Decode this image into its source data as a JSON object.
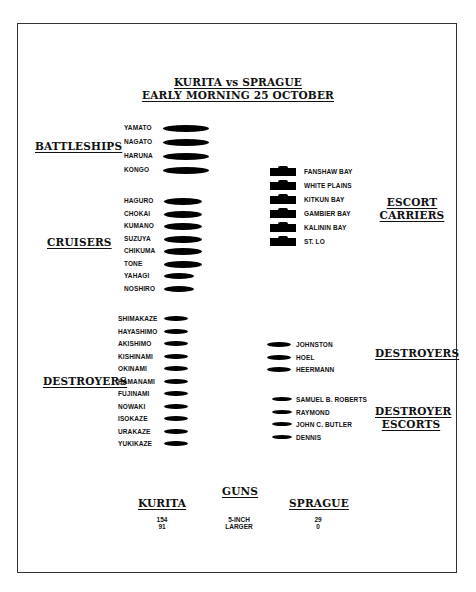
{
  "title": {
    "line1": "KURITA vs SPRAGUE",
    "line2": "EARLY MORNING 25 OCTOBER"
  },
  "japanese": {
    "battleships": {
      "label": "BATTLESHIPS",
      "ships": [
        "YAMATO",
        "NAGATO",
        "HARUNA",
        "KONGO"
      ]
    },
    "cruisers": {
      "label": "CRUISERS",
      "ships": [
        "HAGURO",
        "CHOKAI",
        "KUMANO",
        "SUZUYA",
        "CHIKUMA",
        "TONE",
        "YAHAGI",
        "NOSHIRO"
      ]
    },
    "destroyers": {
      "label": "DESTROYERS",
      "ships": [
        "SHIMAKAZE",
        "HAYASHIMO",
        "AKISHIMO",
        "KISHINAMI",
        "OKINAMI",
        "HAMANAMI",
        "FUJINAMI",
        "NOWAKI",
        "ISOKAZE",
        "URAKAZE",
        "YUKIKAZE"
      ]
    }
  },
  "american": {
    "escort_carriers": {
      "label_line1": "ESCORT",
      "label_line2": "CARRIERS",
      "ships": [
        "FANSHAW BAY",
        "WHITE PLAINS",
        "KITKUN BAY",
        "GAMBIER BAY",
        "KALININ BAY",
        "ST. LO"
      ]
    },
    "destroyers": {
      "label": "DESTROYERS",
      "ships": [
        "JOHNSTON",
        "HOEL",
        "HEERMANN"
      ]
    },
    "destroyer_escorts": {
      "label_line1": "DESTROYER",
      "label_line2": "ESCORTS",
      "ships": [
        "SAMUEL B. ROBERTS",
        "RAYMOND",
        "JOHN C. BUTLER",
        "DENNIS"
      ]
    }
  },
  "guns": {
    "heading": "GUNS",
    "left_header": "KURITA",
    "right_header": "SPRAGUE",
    "rows": [
      {
        "kurita": "154",
        "type": "5-INCH",
        "sprague": "29"
      },
      {
        "kurita": "91",
        "type": "LARGER",
        "sprague": "0"
      }
    ]
  }
}
